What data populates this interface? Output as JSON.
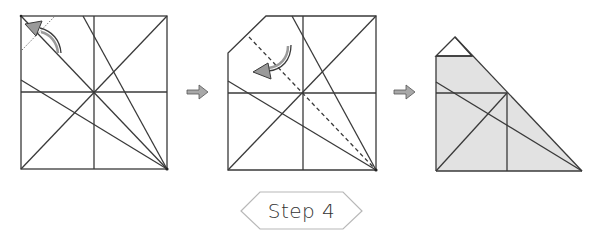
{
  "caption": {
    "step_label": "Step 4"
  },
  "colors": {
    "line": "#3a3a3a",
    "fold_arrow_fill": "#9a9a9a",
    "flow_arrow_fill": "#a8a8a8",
    "shaded_region": "#e2e2e2",
    "badge_border": "#b8b8b8",
    "label_text": "#333333"
  },
  "panels": [
    {
      "id": "panel-1",
      "description": "Square with crease lines; valley fold of top-left corner along dotted line, curved arrow pointing to corner"
    },
    {
      "id": "panel-2",
      "description": "Square with top-left corner folded; dashed diagonal valley fold line with curved arrow indicating fold"
    },
    {
      "id": "panel-3",
      "description": "Resulting shaded triangular shape with small triangle flap on top"
    }
  ],
  "flow_arrows": [
    {
      "id": "arrow-1-to-2",
      "direction": "right"
    },
    {
      "id": "arrow-2-to-3",
      "direction": "right"
    }
  ]
}
